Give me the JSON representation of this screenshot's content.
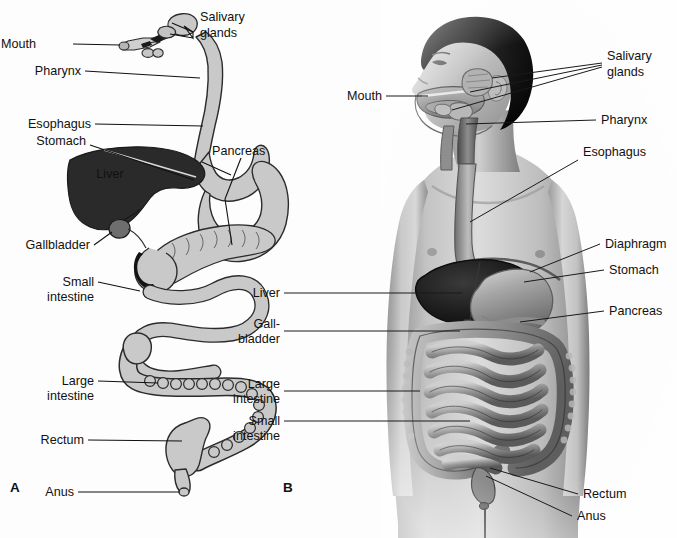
{
  "figure": {
    "background_color": "#fdfdfd",
    "text_color": "#111111",
    "panels": [
      {
        "letter": "A",
        "name": "schematic-digestive-tract",
        "description": "Simplified schematic outline of the alimentary canal with liver and pancreas"
      },
      {
        "letter": "B",
        "name": "anatomical-human-figure",
        "description": "Shaded anatomical drawing of a male torso and head showing digestive organs in situ"
      }
    ]
  },
  "panel_a": {
    "letter": "A",
    "labels": [
      {
        "id": "mouth",
        "text": "Mouth"
      },
      {
        "id": "salivary",
        "text": "Salivary",
        "text2": "glands"
      },
      {
        "id": "pharynx",
        "text": "Pharynx"
      },
      {
        "id": "esophagus",
        "text": "Esophagus"
      },
      {
        "id": "stomach",
        "text": "Stomach"
      },
      {
        "id": "liver",
        "text": "Liver"
      },
      {
        "id": "pancreas",
        "text": "Pancreas"
      },
      {
        "id": "gallbladder",
        "text": "Gallbladder"
      },
      {
        "id": "small-intestine",
        "text": "Small",
        "text2": "intestine"
      },
      {
        "id": "large-intestine",
        "text": "Large",
        "text2": "intestine"
      },
      {
        "id": "rectum",
        "text": "Rectum"
      },
      {
        "id": "anus",
        "text": "Anus"
      }
    ],
    "colors": {
      "organ_fill": "#c9c9c9",
      "organ_stroke": "#2b2b2b",
      "liver_fill": "#2a2a2a",
      "gallbladder_fill": "#6e6e6e"
    }
  },
  "panel_b": {
    "letter": "B",
    "labels_right": [
      {
        "id": "salivary",
        "text": "Salivary",
        "text2": "glands"
      },
      {
        "id": "pharynx",
        "text": "Pharynx"
      },
      {
        "id": "esophagus",
        "text": "Esophagus"
      },
      {
        "id": "diaphragm",
        "text": "Diaphragm"
      },
      {
        "id": "stomach",
        "text": "Stomach"
      },
      {
        "id": "pancreas",
        "text": "Pancreas"
      },
      {
        "id": "rectum",
        "text": "Rectum"
      },
      {
        "id": "anus",
        "text": "Anus"
      }
    ],
    "labels_left": [
      {
        "id": "mouth",
        "text": "Mouth"
      },
      {
        "id": "liver",
        "text": "Liver"
      },
      {
        "id": "gallbladder",
        "text": "Gall-",
        "text2": "bladder"
      },
      {
        "id": "large-intestine",
        "text": "Large",
        "text2": "intestine"
      },
      {
        "id": "small-intestine",
        "text": "Small",
        "text2": "intestine"
      }
    ],
    "colors": {
      "skin_light": "#d3d3d3",
      "skin_mid": "#a8a8a8",
      "skin_dark": "#6f6f6f",
      "hair": "#121212",
      "liver_fill": "#1d1d1d",
      "stomach_fill": "#9a9a9a",
      "intestine_fill": "#8d8d8d"
    }
  }
}
